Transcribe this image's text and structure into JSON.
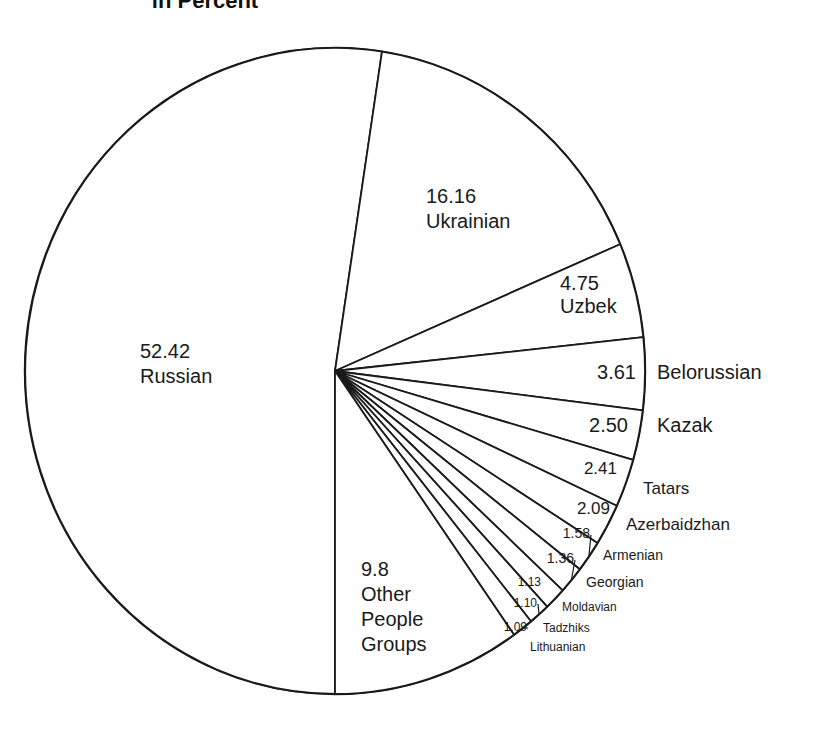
{
  "chart_data": {
    "type": "pie",
    "title": "in Percent",
    "start": "bottom",
    "direction": "clockwise",
    "unit": "%",
    "slices": [
      {
        "name": "Russian",
        "value": 52.42,
        "value_label": "52.42"
      },
      {
        "name": "Ukrainian",
        "value": 16.16,
        "value_label": "16.16"
      },
      {
        "name": "Uzbek",
        "value": 4.75,
        "value_label": "4.75"
      },
      {
        "name": "Belorussian",
        "value": 3.61,
        "value_label": "3.61"
      },
      {
        "name": "Kazak",
        "value": 2.5,
        "value_label": "2.50"
      },
      {
        "name": "Tatars",
        "value": 2.41,
        "value_label": "2.41"
      },
      {
        "name": "Azerbaidzhan",
        "value": 2.09,
        "value_label": "2.09"
      },
      {
        "name": "Armenian",
        "value": 1.58,
        "value_label": "1.58"
      },
      {
        "name": "Georgian",
        "value": 1.36,
        "value_label": "1.36"
      },
      {
        "name": "Moldavian",
        "value": 1.13,
        "value_label": "1.13"
      },
      {
        "name": "Tadzhiks",
        "value": 1.1,
        "value_label": "1.10"
      },
      {
        "name": "Lithuanian",
        "value": 1.09,
        "value_label": "1.09"
      },
      {
        "name": "Other People Groups",
        "value": 9.8,
        "value_label": "9.8",
        "name_lines": [
          "Other",
          "People",
          "Groups"
        ]
      }
    ],
    "colors": {
      "fill": "#ffffff",
      "stroke": "#1a1a1a"
    }
  }
}
